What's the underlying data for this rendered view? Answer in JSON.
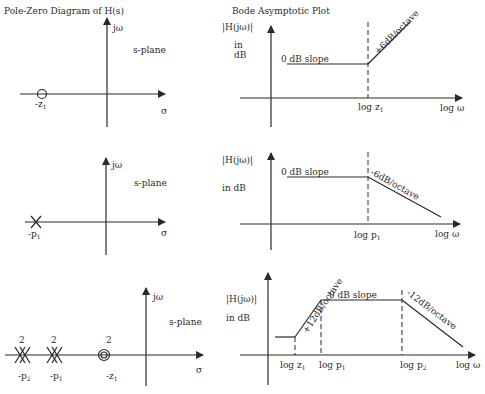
{
  "titles": {
    "left": "Pole-Zero Diagram of H(s)",
    "right": "Bode Asymptotic Plot"
  },
  "labels": {
    "jw": "jω",
    "sigma": "σ",
    "s_plane": "s-plane",
    "mag": "|H(jω)|",
    "in": "in",
    "db": "dB",
    "in_db": "in dB",
    "log_w": "log ω",
    "zero_slope": "0 dB slope"
  },
  "rows": [
    {
      "pz": {
        "markers": [
          {
            "type": "zero",
            "label": "-z",
            "sub": "1",
            "order": 1
          }
        ]
      },
      "bode": {
        "breaks": [
          {
            "label": "log z",
            "sub": "1"
          }
        ],
        "slopes": [
          "0 dB slope",
          "+6dB/octave"
        ]
      }
    },
    {
      "pz": {
        "markers": [
          {
            "type": "pole",
            "label": "-p",
            "sub": "1",
            "order": 1
          }
        ]
      },
      "bode": {
        "breaks": [
          {
            "label": "log p",
            "sub": "1"
          }
        ],
        "slopes": [
          "0 dB slope",
          "-6dB/octave"
        ]
      }
    },
    {
      "pz": {
        "markers": [
          {
            "type": "pole",
            "label": "-p",
            "sub": "2",
            "order": "2"
          },
          {
            "type": "pole",
            "label": "-p",
            "sub": "1",
            "order": "2"
          },
          {
            "type": "zero",
            "label": "-z",
            "sub": "1",
            "order": "2"
          }
        ]
      },
      "bode": {
        "breaks": [
          {
            "label": "log z",
            "sub": "1"
          },
          {
            "label": "log p",
            "sub": "1"
          },
          {
            "label": "log p",
            "sub": "2"
          }
        ],
        "slopes": [
          "+12dB/octave",
          "0 dB slope",
          "-12dB/octave"
        ]
      }
    }
  ]
}
